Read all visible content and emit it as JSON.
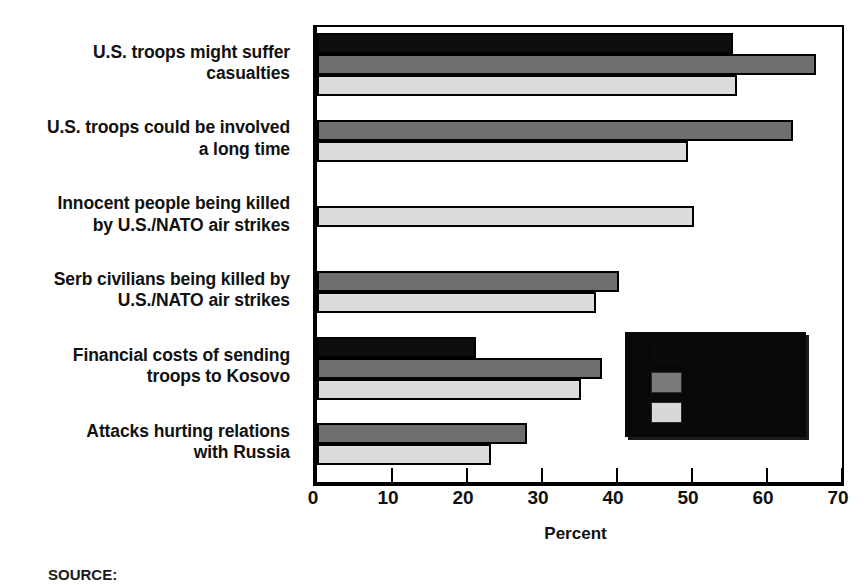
{
  "chart_data": {
    "type": "bar",
    "orientation": "horizontal",
    "title": "",
    "xlabel": "Percent",
    "ylabel": "",
    "xlim": [
      0,
      70
    ],
    "xticks": [
      0,
      10,
      20,
      30,
      40,
      50,
      60,
      70
    ],
    "xtick_labels": [
      "0",
      "10",
      "20",
      "30",
      "40",
      "50",
      "60",
      "70"
    ],
    "grid": false,
    "legend_position": "inside-lower-right",
    "legend_state": "redacted-black-box",
    "categories": [
      "U.S. troops might suffer casualties",
      "U.S. troops could be involved a long time",
      "Innocent people being killed by U.S./NATO air strikes",
      "Serb civilians being killed by U.S./NATO air strikes",
      "Financial costs of sending troops to Kosovo",
      "Attacks hurting relations with Russia"
    ],
    "category_lines": [
      [
        "U.S. troops might suffer",
        "casualties"
      ],
      [
        "U.S. troops could be involved",
        "a long time"
      ],
      [
        "Innocent people being killed",
        "by U.S./NATO air strikes"
      ],
      [
        "Serb civilians being killed by",
        "U.S./NATO air strikes"
      ],
      [
        "Financial costs of sending",
        "troops to Kosovo"
      ],
      [
        "Attacks hurting relations",
        "with Russia"
      ]
    ],
    "series": [
      {
        "name": "",
        "style": "black",
        "color": "#0d0d0d",
        "values": [
          55.5,
          null,
          null,
          null,
          21.2,
          null
        ]
      },
      {
        "name": "",
        "style": "dark-gray",
        "color": "#6e6e6e",
        "values": [
          66.5,
          63.5,
          null,
          40.2,
          38.0,
          28.0
        ]
      },
      {
        "name": "",
        "style": "light-gray",
        "color": "#dcdcdc",
        "values": [
          56.0,
          49.5,
          50.2,
          37.2,
          35.2,
          23.2
        ]
      }
    ]
  },
  "axis": {
    "title": "Percent"
  },
  "legend": {
    "swatches": [
      "black",
      "dark-gray",
      "light-gray"
    ],
    "labels": [
      "",
      "",
      ""
    ]
  },
  "footer": {
    "source": "SOURCE:"
  }
}
